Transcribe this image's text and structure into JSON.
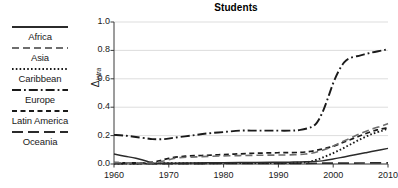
{
  "chart_data": {
    "type": "line",
    "title": "Students",
    "xlabel": "",
    "ylabel": "Δ",
    "ylabel_sub": "intra",
    "xlim": [
      1960,
      2010
    ],
    "ylim": [
      0.0,
      1.0
    ],
    "xticks": [
      1960,
      1970,
      1980,
      1990,
      2000,
      2010
    ],
    "yticks": [
      "0.0",
      "0.2",
      "0.4",
      "0.6",
      "0.8",
      "1.0"
    ],
    "grid": "horizontal",
    "legend_position": "left-outside",
    "series": [
      {
        "name": "Africa",
        "style": "solid",
        "color": "#2b2b2b",
        "x": [
          1960,
          1962,
          1964,
          1966,
          1967,
          1969,
          1971,
          1974,
          1977,
          1980,
          1983,
          1986,
          1989,
          1992,
          1995,
          1998,
          2000,
          2002,
          2004,
          2006,
          2008,
          2010
        ],
        "values": [
          0.07,
          0.055,
          0.04,
          0.02,
          0.005,
          0.005,
          0.006,
          0.007,
          0.008,
          0.009,
          0.01,
          0.011,
          0.012,
          0.013,
          0.015,
          0.022,
          0.035,
          0.05,
          0.065,
          0.08,
          0.095,
          0.11
        ]
      },
      {
        "name": "Asia",
        "style": "dashed",
        "color": "#6e6e6e",
        "x": [
          1960,
          1963,
          1966,
          1968,
          1970,
          1972,
          1975,
          1978,
          1981,
          1984,
          1987,
          1990,
          1993,
          1995,
          1997,
          1999,
          2001,
          2003,
          2005,
          2007,
          2009,
          2010
        ],
        "values": [
          0.01,
          0.008,
          0.007,
          0.012,
          0.03,
          0.045,
          0.05,
          0.055,
          0.058,
          0.06,
          0.062,
          0.063,
          0.065,
          0.07,
          0.085,
          0.11,
          0.145,
          0.18,
          0.215,
          0.245,
          0.27,
          0.285
        ]
      },
      {
        "name": "Caribbean",
        "style": "dotted",
        "color": "#1a1a1a",
        "x": [
          1960,
          1965,
          1970,
          1975,
          1980,
          1985,
          1990,
          1993,
          1995,
          1997,
          1999,
          2001,
          2003,
          2005,
          2007,
          2009,
          2010
        ],
        "values": [
          0.004,
          0.004,
          0.005,
          0.005,
          0.006,
          0.006,
          0.007,
          0.008,
          0.012,
          0.03,
          0.06,
          0.095,
          0.135,
          0.175,
          0.21,
          0.235,
          0.25
        ]
      },
      {
        "name": "Europe",
        "style": "dashdot",
        "color": "#1a1a1a",
        "x": [
          1960,
          1962,
          1964,
          1966,
          1967,
          1969,
          1971,
          1974,
          1977,
          1980,
          1983,
          1986,
          1989,
          1992,
          1994,
          1996,
          1997,
          1998,
          1999,
          2000,
          2001,
          2002,
          2003,
          2005,
          2007,
          2009,
          2010
        ],
        "values": [
          0.205,
          0.2,
          0.19,
          0.18,
          0.175,
          0.175,
          0.185,
          0.2,
          0.215,
          0.225,
          0.235,
          0.235,
          0.235,
          0.235,
          0.24,
          0.26,
          0.29,
          0.36,
          0.46,
          0.57,
          0.655,
          0.715,
          0.745,
          0.765,
          0.785,
          0.8,
          0.81
        ]
      },
      {
        "name": "Latin America",
        "style": "shortdash",
        "color": "#1a1a1a",
        "x": [
          1960,
          1963,
          1966,
          1968,
          1970,
          1973,
          1976,
          1979,
          1982,
          1985,
          1988,
          1991,
          1994,
          1996,
          1998,
          2000,
          2002,
          2004,
          2006,
          2008,
          2010
        ],
        "values": [
          0.01,
          0.008,
          0.008,
          0.02,
          0.04,
          0.055,
          0.06,
          0.065,
          0.07,
          0.075,
          0.078,
          0.08,
          0.082,
          0.09,
          0.105,
          0.125,
          0.155,
          0.185,
          0.215,
          0.24,
          0.255
        ]
      },
      {
        "name": "Oceania",
        "style": "longdash",
        "color": "#2b2b2b",
        "x": [
          1960,
          1965,
          1970,
          1975,
          1980,
          1985,
          1990,
          1995,
          2000,
          2005,
          2010
        ],
        "values": [
          0.002,
          0.002,
          0.003,
          0.003,
          0.004,
          0.004,
          0.005,
          0.005,
          0.006,
          0.007,
          0.008
        ]
      }
    ]
  },
  "legend": {
    "items": [
      {
        "label": "Africa",
        "style": "solid"
      },
      {
        "label": "Asia",
        "style": "dashed"
      },
      {
        "label": "Caribbean",
        "style": "dotted"
      },
      {
        "label": "Europe",
        "style": "dashdot"
      },
      {
        "label": "Latin America",
        "style": "shortdash"
      },
      {
        "label": "Oceania",
        "style": "longdash"
      }
    ]
  },
  "colors": {
    "axis": "#3a3a3a",
    "grid": "#cfcfcf",
    "text": "#1a1a1a",
    "background": "#ffffff"
  }
}
